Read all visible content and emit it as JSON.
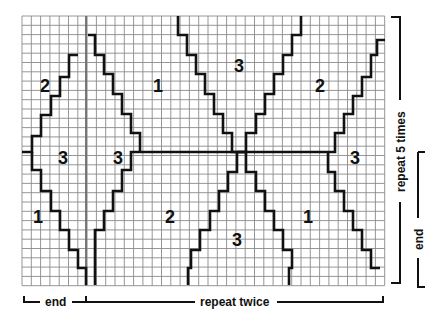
{
  "grid": {
    "x0": 22,
    "y0": 16,
    "cols": 39,
    "rows": 29,
    "cell": 9.3,
    "line_color": "#8a8a8a",
    "outline_color": "#111111"
  },
  "divider_vertical": {
    "x": 86
  },
  "divider_horizontal": {
    "y": 152,
    "x1": 140,
    "x2": 328
  },
  "paths": [
    {
      "name": "left-diamond-left-arm-top",
      "points": "22,152 32,152 32,136 41,136 41,115 51,115 51,96 60,96 60,77 69,77 69,55 78,55"
    },
    {
      "name": "left-diamond-right-arm-top",
      "points": "88,35 95,35 95,55 104,55 104,74 113,74 113,94 122,94 122,114 131,114 131,133 140,133 140,152"
    },
    {
      "name": "left-diamond-left-arm-bottom",
      "points": "32,152 32,170 41,170 41,191 51,191 51,211 60,211 60,230 69,230 69,250 78,250 78,268 86,268 86,285"
    },
    {
      "name": "left-diamond-right-arm-bottom",
      "points": "140,152 131,152 131,170 122,170 122,191 113,191 113,211 104,211 104,230 95,230 95,268 95,285"
    },
    {
      "name": "center-v-left-arm",
      "points": "178,16 178,35 187,35 187,55 196,55 196,74 205,74 205,94 214,94 214,114 223,114 223,133 232,133 232,152 237,152"
    },
    {
      "name": "center-v-right-arm",
      "points": "301,16 301,35 292,35 292,55 283,55 283,74 274,74 274,94 265,94 265,114 256,114 256,133 246,133 246,152 237,152"
    },
    {
      "name": "center-inv-v-left-arm",
      "points": "237,152 237,172 228,172 228,191 219,191 219,211 210,211 210,230 200,230 200,250 191,250 191,268 188,268 188,285"
    },
    {
      "name": "center-inv-v-right-arm",
      "points": "237,152 246,152 246,172 256,172 256,191 265,191 265,211 274,211 274,230 283,230 283,250 292,250 292,268 289,268 289,285"
    },
    {
      "name": "right-diamond-upper",
      "points": "328,152 335,152 335,133 344,133 344,114 353,114 353,96 362,96 362,77 371,77 371,55 377,55 377,40 385,40"
    },
    {
      "name": "right-diamond-lower",
      "points": "328,152 328,172 335,172 335,191 344,191 344,211 353,211 353,230 362,230 362,250 371,250 371,268 380,268"
    }
  ],
  "region_numbers": [
    {
      "label": "2",
      "x": 45,
      "y": 92
    },
    {
      "label": "1",
      "x": 158,
      "y": 92
    },
    {
      "label": "3",
      "x": 239,
      "y": 72
    },
    {
      "label": "2",
      "x": 320,
      "y": 92
    },
    {
      "label": "3",
      "x": 63,
      "y": 164
    },
    {
      "label": "3",
      "x": 118,
      "y": 164
    },
    {
      "label": "3",
      "x": 355,
      "y": 164
    },
    {
      "label": "1",
      "x": 38,
      "y": 223
    },
    {
      "label": "2",
      "x": 170,
      "y": 223
    },
    {
      "label": "1",
      "x": 308,
      "y": 223
    },
    {
      "label": "3",
      "x": 237,
      "y": 246
    }
  ],
  "brackets": {
    "bottom_end_label": "end",
    "bottom_repeat_label": "repeat twice",
    "right_repeat_label": "repeat 5 times",
    "right_end_label": "end"
  }
}
